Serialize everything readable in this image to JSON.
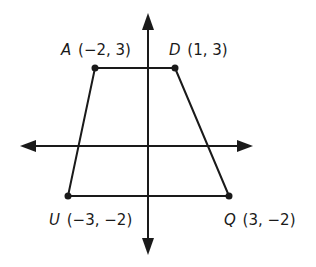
{
  "diagram": {
    "type": "coordinate-plane-quadrilateral",
    "shape": "trapezoid",
    "colors": {
      "stroke": "#1a1a1a",
      "background": "#ffffff"
    },
    "axes": {
      "x_axis": {
        "arrows": "both"
      },
      "y_axis": {
        "arrows": "both"
      }
    },
    "vertices": [
      {
        "name": "A",
        "coords": "(−2, 3)",
        "x": -2,
        "y": 3
      },
      {
        "name": "D",
        "coords": "(1, 3)",
        "x": 1,
        "y": 3
      },
      {
        "name": "Q",
        "coords": "(3, −2)",
        "x": 3,
        "y": -2
      },
      {
        "name": "U",
        "coords": "(−3, −2)",
        "x": -3,
        "y": -2
      }
    ]
  }
}
